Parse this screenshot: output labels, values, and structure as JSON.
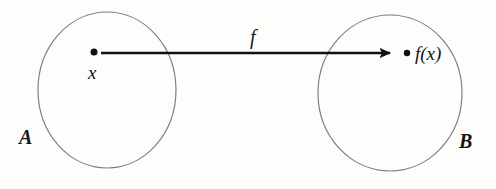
{
  "figure": {
    "kind": "function-mapping-diagram",
    "background_color": "#fdfdfc",
    "ink_color": "#141414",
    "outline_color": "#7a7a7a",
    "domain_set": {
      "label": "A",
      "center_x": 107,
      "center_y": 90,
      "radius_x": 69,
      "radius_y": 78,
      "label_x": 19,
      "label_y": 127
    },
    "codomain_set": {
      "label": "B",
      "center_x": 390,
      "center_y": 93,
      "radius_x": 72,
      "radius_y": 78,
      "label_x": 459,
      "label_y": 131
    },
    "source_point": {
      "label": "x",
      "dot_x": 94,
      "dot_y": 52,
      "dot_r": 3.4,
      "label_x": 88,
      "label_y": 63
    },
    "target_point": {
      "label": "f(x)",
      "dot_x": 407,
      "dot_y": 53,
      "dot_r": 3.2,
      "label_x": 415,
      "label_y": 43
    },
    "arrow": {
      "label": "f",
      "start_x": 101,
      "start_y": 53,
      "end_x": 398,
      "end_y": 53,
      "stroke_width": 2.6,
      "head_width": 11,
      "head_length": 17,
      "label_x": 250,
      "label_y": 27
    }
  }
}
